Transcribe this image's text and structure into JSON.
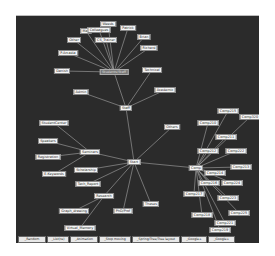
{
  "graph": {
    "nodes": [
      {
        "id": "root",
        "label": "Start",
        "x": 118,
        "y": 146
      },
      {
        "id": "staff",
        "label": "Staff",
        "x": 110,
        "y": 92
      },
      {
        "id": "hub_top",
        "label": "Students/Staff",
        "x": 98,
        "y": 56,
        "dim": true
      },
      {
        "id": "weeds",
        "label": "Weeds",
        "x": 92,
        "y": 8
      },
      {
        "id": "patrick",
        "label": "Patrick",
        "x": 112,
        "y": 12
      },
      {
        "id": "max",
        "label": "Max",
        "x": 70,
        "y": 15
      },
      {
        "id": "colleagues",
        "label": "Colleagues",
        "x": 83,
        "y": 14
      },
      {
        "id": "other_top",
        "label": "Other",
        "x": 58,
        "y": 24
      },
      {
        "id": "cs_trainer",
        "label": "CS_Trainer",
        "x": 90,
        "y": 24
      },
      {
        "id": "brian",
        "label": "Brian",
        "x": 128,
        "y": 21
      },
      {
        "id": "richard",
        "label": "Richard",
        "x": 133,
        "y": 32
      },
      {
        "id": "pasadena",
        "label": "P.Arcadia",
        "x": 52,
        "y": 37
      },
      {
        "id": "danish",
        "label": "Danish",
        "x": 46,
        "y": 55
      },
      {
        "id": "technical",
        "label": "Technical",
        "x": 136,
        "y": 54
      },
      {
        "id": "admin",
        "label": "Admin",
        "x": 65,
        "y": 76
      },
      {
        "id": "academic",
        "label": "Academic",
        "x": 149,
        "y": 74
      },
      {
        "id": "others",
        "label": "Others",
        "x": 156,
        "y": 111
      },
      {
        "id": "seminars",
        "label": "Seminars",
        "x": 74,
        "y": 136
      },
      {
        "id": "studentcenter",
        "label": "StudentCenter",
        "x": 38,
        "y": 107
      },
      {
        "id": "speakers",
        "label": "Speakers",
        "x": 32,
        "y": 125
      },
      {
        "id": "registration",
        "label": "Registration",
        "x": 32,
        "y": 141
      },
      {
        "id": "ekeywords",
        "label": "E.Keywords",
        "x": 38,
        "y": 158
      },
      {
        "id": "scholarship",
        "label": "Scholarship",
        "x": 70,
        "y": 154
      },
      {
        "id": "tech_report",
        "label": "Tech_Report",
        "x": 72,
        "y": 168
      },
      {
        "id": "research",
        "label": "Research",
        "x": 88,
        "y": 180
      },
      {
        "id": "graph_drawing",
        "label": "Graph_drawing",
        "x": 58,
        "y": 195
      },
      {
        "id": "virtual_memory",
        "label": "Virtual_Memory",
        "x": 64,
        "y": 212
      },
      {
        "id": "phd_prof",
        "label": "PhD/Prof",
        "x": 107,
        "y": 195
      },
      {
        "id": "theses",
        "label": "Theses",
        "x": 135,
        "y": 188
      },
      {
        "id": "hub_right",
        "label": "Comp",
        "x": 180,
        "y": 152
      },
      {
        "id": "comp215",
        "label": "Comp215",
        "x": 212,
        "y": 95
      },
      {
        "id": "comp320",
        "label": "Comp320",
        "x": 234,
        "y": 101
      },
      {
        "id": "comp210",
        "label": "Comp210",
        "x": 192,
        "y": 107
      },
      {
        "id": "comp211",
        "label": "Comp211",
        "x": 210,
        "y": 121
      },
      {
        "id": "comp212",
        "label": "Comp212",
        "x": 192,
        "y": 135
      },
      {
        "id": "comp222",
        "label": "Comp222",
        "x": 220,
        "y": 135
      },
      {
        "id": "comp214",
        "label": "Comp214",
        "x": 199,
        "y": 157
      },
      {
        "id": "comp213",
        "label": "Comp213",
        "x": 225,
        "y": 151
      },
      {
        "id": "comp216",
        "label": "Comp216",
        "x": 193,
        "y": 167
      },
      {
        "id": "comp224",
        "label": "Comp224",
        "x": 216,
        "y": 167
      },
      {
        "id": "comp217",
        "label": "Comp217",
        "x": 178,
        "y": 178
      },
      {
        "id": "comp223",
        "label": "Comp223",
        "x": 212,
        "y": 182
      },
      {
        "id": "comp218",
        "label": "Comp218",
        "x": 186,
        "y": 199
      },
      {
        "id": "comp225",
        "label": "Comp225",
        "x": 223,
        "y": 197
      },
      {
        "id": "comp221",
        "label": "Comp221",
        "x": 209,
        "y": 207
      },
      {
        "id": "comp219",
        "label": "Comp219",
        "x": 204,
        "y": 214
      }
    ],
    "edges": [
      [
        "root",
        "staff"
      ],
      [
        "staff",
        "hub_top"
      ],
      [
        "staff",
        "admin"
      ],
      [
        "staff",
        "academic"
      ],
      [
        "staff",
        "technical"
      ],
      [
        "hub_top",
        "weeds"
      ],
      [
        "hub_top",
        "patrick"
      ],
      [
        "hub_top",
        "max"
      ],
      [
        "hub_top",
        "colleagues"
      ],
      [
        "hub_top",
        "other_top"
      ],
      [
        "hub_top",
        "cs_trainer"
      ],
      [
        "hub_top",
        "brian"
      ],
      [
        "hub_top",
        "richard"
      ],
      [
        "hub_top",
        "pasadena"
      ],
      [
        "hub_top",
        "danish"
      ],
      [
        "root",
        "others"
      ],
      [
        "root",
        "seminars"
      ],
      [
        "seminars",
        "studentcenter"
      ],
      [
        "seminars",
        "speakers"
      ],
      [
        "seminars",
        "registration"
      ],
      [
        "seminars",
        "ekeywords"
      ],
      [
        "root",
        "scholarship"
      ],
      [
        "root",
        "tech_report"
      ],
      [
        "root",
        "research"
      ],
      [
        "research",
        "graph_drawing"
      ],
      [
        "research",
        "virtual_memory"
      ],
      [
        "root",
        "phd_prof"
      ],
      [
        "root",
        "theses"
      ],
      [
        "root",
        "hub_right"
      ],
      [
        "hub_right",
        "comp215"
      ],
      [
        "hub_right",
        "comp320"
      ],
      [
        "hub_right",
        "comp210"
      ],
      [
        "hub_right",
        "comp211"
      ],
      [
        "hub_right",
        "comp212"
      ],
      [
        "hub_right",
        "comp222"
      ],
      [
        "hub_right",
        "comp214"
      ],
      [
        "hub_right",
        "comp213"
      ],
      [
        "hub_right",
        "comp216"
      ],
      [
        "hub_right",
        "comp224"
      ],
      [
        "hub_right",
        "comp217"
      ],
      [
        "hub_right",
        "comp223"
      ],
      [
        "hub_right",
        "comp218"
      ],
      [
        "hub_right",
        "comp225"
      ],
      [
        "hub_right",
        "comp221"
      ],
      [
        "hub_right",
        "comp219"
      ]
    ]
  },
  "toolbar": {
    "buttons": [
      {
        "label": "_Random",
        "x": 2,
        "w": 26
      },
      {
        "label": "_List(re)",
        "x": 31,
        "w": 20
      },
      {
        "label": "_Animation",
        "x": 54,
        "w": 26
      },
      {
        "label": "_Stop moving",
        "x": 83,
        "w": 30
      },
      {
        "label": "_Spring/Tree/Tree layout",
        "x": 116,
        "w": 46
      },
      {
        "label": "_Google+",
        "x": 165,
        "w": 24
      },
      {
        "label": "_Google+",
        "x": 192,
        "w": 25
      }
    ]
  },
  "colors": {
    "canvas": "#2b2b2b",
    "edge": "#bfbfbf",
    "node_bg": "#f4f4f4"
  }
}
